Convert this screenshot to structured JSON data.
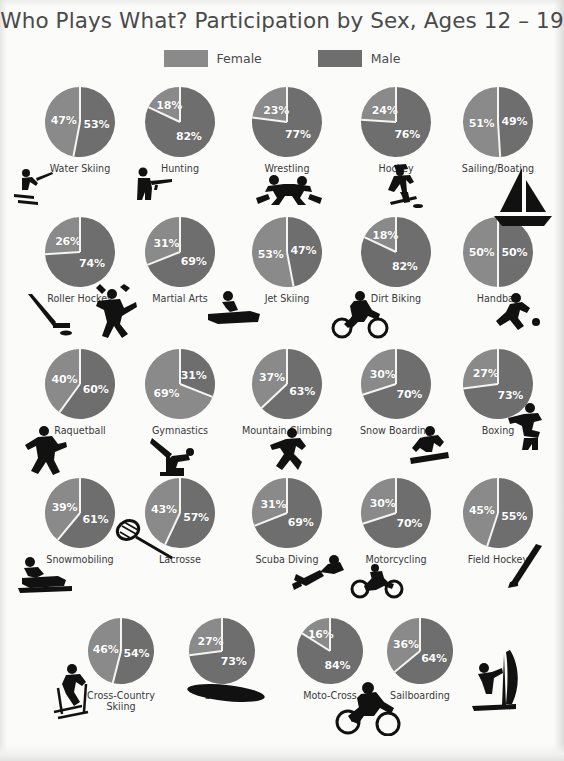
{
  "title": "Who Plays What? Participation by Sex, Ages 12 – 19",
  "legend": {
    "female": {
      "label": "Female",
      "color": "#8a8a8a"
    },
    "male": {
      "label": "Male",
      "color": "#6e6e6e"
    }
  },
  "colors": {
    "female_slice": "#8a8a8a",
    "male_slice": "#6e6e6e",
    "slice_divider": "#f5f5f3",
    "percent_text": "#ffffff",
    "label_text": "#3a3a3a",
    "icon": "#111111",
    "page_background": "#fbfbfa"
  },
  "chart_data": {
    "type": "pie",
    "title": "Who Plays What? Participation by Sex, Ages 12 – 19",
    "subtitle": "",
    "legend_entries": [
      "Female",
      "Male"
    ],
    "legend_position": "top-center",
    "series": [
      {
        "name": "Female",
        "color": "#8a8a8a"
      },
      {
        "name": "Male",
        "color": "#6e6e6e"
      }
    ],
    "units": "percent",
    "categories": [
      "Water Skiing",
      "Hunting",
      "Wrestling",
      "Hockey",
      "Sailing/Boating",
      "Roller Hockey",
      "Martial Arts",
      "Jet Skiing",
      "Dirt Biking",
      "Handball",
      "Raquetball",
      "Gymnastics",
      "Mountain Climbing",
      "Snow Boarding",
      "Boxing",
      "Snowmobiling",
      "Lacrosse",
      "Scuba Diving",
      "Motorcycling",
      "Field Hockey",
      "Cross-Country Skiing",
      "Surfing",
      "Moto-Cross",
      "Sailboarding"
    ],
    "female_values": [
      47,
      18,
      23,
      24,
      51,
      26,
      31,
      53,
      18,
      50,
      40,
      69,
      37,
      30,
      27,
      39,
      43,
      31,
      30,
      45,
      46,
      27,
      16,
      36
    ],
    "male_values": [
      53,
      82,
      77,
      76,
      49,
      74,
      69,
      47,
      82,
      50,
      60,
      31,
      63,
      70,
      73,
      61,
      57,
      69,
      70,
      55,
      54,
      73,
      84,
      64
    ]
  },
  "pies": [
    {
      "sport": "Water Skiing",
      "female": "47%",
      "male": "53%",
      "icon": "water-skiing-icon"
    },
    {
      "sport": "Hunting",
      "female": "18%",
      "male": "82%",
      "icon": "hunting-icon"
    },
    {
      "sport": "Wrestling",
      "female": "23%",
      "male": "77%",
      "icon": "wrestling-icon"
    },
    {
      "sport": "Hockey",
      "female": "24%",
      "male": "76%",
      "icon": "hockey-icon"
    },
    {
      "sport": "Sailing/Boating",
      "female": "51%",
      "male": "49%",
      "icon": "sailboat-icon"
    },
    {
      "sport": "Roller Hockey",
      "female": "26%",
      "male": "74%",
      "icon": "roller-hockey-icon"
    },
    {
      "sport": "Martial Arts",
      "female": "31%",
      "male": "69%",
      "icon": "martial-arts-icon"
    },
    {
      "sport": "Jet Skiing",
      "female": "53%",
      "male": "47%",
      "icon": "jet-ski-icon"
    },
    {
      "sport": "Dirt Biking",
      "female": "18%",
      "male": "82%",
      "icon": "dirt-bike-icon"
    },
    {
      "sport": "Handball",
      "female": "50%",
      "male": "50%",
      "icon": "handball-icon"
    },
    {
      "sport": "Raquetball",
      "female": "40%",
      "male": "60%",
      "icon": "raquetball-icon"
    },
    {
      "sport": "Gymnastics",
      "female": "69%",
      "male": "31%",
      "icon": "gymnastics-icon"
    },
    {
      "sport": "Mountain Climbing",
      "female": "37%",
      "male": "63%",
      "icon": "mountain-climbing-icon"
    },
    {
      "sport": "Snow Boarding",
      "female": "30%",
      "male": "70%",
      "icon": "snowboarding-icon"
    },
    {
      "sport": "Boxing",
      "female": "27%",
      "male": "73%",
      "icon": "boxing-icon"
    },
    {
      "sport": "Snowmobiling",
      "female": "39%",
      "male": "61%",
      "icon": "snowmobile-icon"
    },
    {
      "sport": "Lacrosse",
      "female": "43%",
      "male": "57%",
      "icon": "lacrosse-icon"
    },
    {
      "sport": "Scuba Diving",
      "female": "31%",
      "male": "69%",
      "icon": "scuba-diving-icon"
    },
    {
      "sport": "Motorcycling",
      "female": "30%",
      "male": "70%",
      "icon": "motorcycle-icon"
    },
    {
      "sport": "Field Hockey",
      "female": "45%",
      "male": "55%",
      "icon": "field-hockey-icon"
    },
    {
      "sport": "Cross-Country Skiing",
      "female": "46%",
      "male": "54%",
      "icon": "cross-country-ski-icon"
    },
    {
      "sport": "Surfing",
      "female": "27%",
      "male": "73%",
      "icon": "surfboard-icon"
    },
    {
      "sport": "Moto-Cross",
      "female": "16%",
      "male": "84%",
      "icon": "moto-cross-icon"
    },
    {
      "sport": "Sailboarding",
      "female": "36%",
      "male": "64%",
      "icon": "sailboard-icon"
    }
  ]
}
